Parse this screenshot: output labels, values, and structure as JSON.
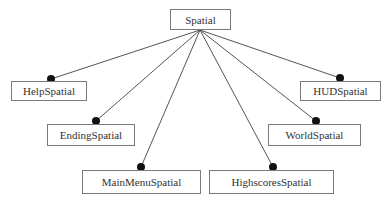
{
  "diagram": {
    "type": "class-hierarchy",
    "root": {
      "id": "spatial",
      "label": "Spatial",
      "x": 170,
      "y": 9,
      "w": 61,
      "h": 21,
      "anchor": [
        200,
        30
      ]
    },
    "children": [
      {
        "id": "help",
        "label": "HelpSpatial",
        "x": 11,
        "y": 81,
        "w": 76,
        "h": 20,
        "dot": [
          51,
          79
        ]
      },
      {
        "id": "ending",
        "label": "EndingSpatial",
        "x": 47,
        "y": 124,
        "w": 88,
        "h": 22,
        "dot": [
          96,
          121
        ]
      },
      {
        "id": "mainmenu",
        "label": "MainMenuSpatial",
        "x": 82,
        "y": 170,
        "w": 119,
        "h": 24,
        "dot": [
          141,
          167
        ]
      },
      {
        "id": "highscores",
        "label": "HighscoresSpatial",
        "x": 209,
        "y": 170,
        "w": 125,
        "h": 24,
        "dot": [
          273,
          167
        ]
      },
      {
        "id": "world",
        "label": "WorldSpatial",
        "x": 268,
        "y": 124,
        "w": 93,
        "h": 22,
        "dot": [
          316,
          121
        ]
      },
      {
        "id": "hud",
        "label": "HUDSpatial",
        "x": 300,
        "y": 81,
        "w": 81,
        "h": 20,
        "dot": [
          340,
          78
        ]
      }
    ],
    "colors": {
      "line": "#555555",
      "dot": "#111111",
      "border": "#7a7a7a",
      "text": "#333333"
    }
  }
}
